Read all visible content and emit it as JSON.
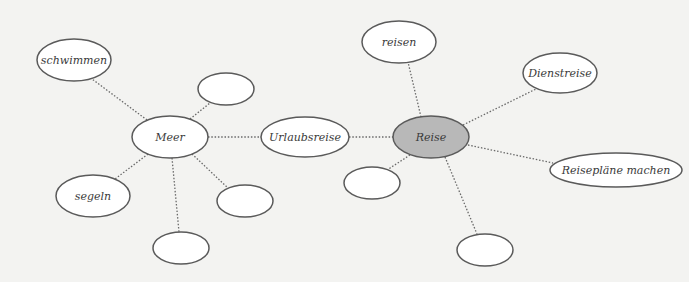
{
  "diagram": {
    "type": "mind-map",
    "center_node": "Reise",
    "colors": {
      "background": "#f3f3f1",
      "node_fill": "#ffffff",
      "center_fill": "#b8b8b8",
      "stroke": "#5a5a5a",
      "edge": "#6a6a6a"
    },
    "nodes": [
      {
        "id": "reise",
        "label": "Reise",
        "cx": 431,
        "cy": 137,
        "rx": 38,
        "ry": 21,
        "center": true
      },
      {
        "id": "urlaubsreise",
        "label": "Urlaubsreise",
        "cx": 305,
        "cy": 137,
        "rx": 44,
        "ry": 20
      },
      {
        "id": "meer",
        "label": "Meer",
        "cx": 170,
        "cy": 137,
        "rx": 38,
        "ry": 21
      },
      {
        "id": "schwimmen",
        "label": "schwimmen",
        "cx": 74,
        "cy": 60,
        "rx": 37,
        "ry": 21
      },
      {
        "id": "segeln",
        "label": "segeln",
        "cx": 93,
        "cy": 196,
        "rx": 37,
        "ry": 21
      },
      {
        "id": "empty-meer-top",
        "label": "",
        "cx": 226,
        "cy": 89,
        "rx": 28,
        "ry": 16
      },
      {
        "id": "empty-meer-right",
        "label": "",
        "cx": 245,
        "cy": 201,
        "rx": 28,
        "ry": 16
      },
      {
        "id": "empty-meer-bottom",
        "label": "",
        "cx": 181,
        "cy": 248,
        "rx": 28,
        "ry": 16
      },
      {
        "id": "reisen",
        "label": "reisen",
        "cx": 399,
        "cy": 42,
        "rx": 37,
        "ry": 21
      },
      {
        "id": "dienstreise",
        "label": "Dienstreise",
        "cx": 560,
        "cy": 73,
        "rx": 37,
        "ry": 20
      },
      {
        "id": "reiseplaene",
        "label": "Reisepläne machen",
        "cx": 616,
        "cy": 170,
        "rx": 66,
        "ry": 17
      },
      {
        "id": "empty-reise-left",
        "label": "",
        "cx": 372,
        "cy": 183,
        "rx": 28,
        "ry": 16
      },
      {
        "id": "empty-reise-bottom",
        "label": "",
        "cx": 485,
        "cy": 250,
        "rx": 28,
        "ry": 16
      }
    ],
    "edges": [
      {
        "from": "meer",
        "to": "urlaubsreise",
        "x1": 208,
        "y1": 137,
        "x2": 261,
        "y2": 137
      },
      {
        "from": "urlaubsreise",
        "to": "reise",
        "x1": 349,
        "y1": 137,
        "x2": 393,
        "y2": 137
      },
      {
        "from": "meer",
        "to": "schwimmen",
        "x1": 147,
        "y1": 120,
        "x2": 92,
        "y2": 79
      },
      {
        "from": "meer",
        "to": "segeln",
        "x1": 148,
        "y1": 154,
        "x2": 115,
        "y2": 179
      },
      {
        "from": "meer",
        "to": "empty-meer-top",
        "x1": 190,
        "y1": 119,
        "x2": 210,
        "y2": 103
      },
      {
        "from": "meer",
        "to": "empty-meer-right",
        "x1": 192,
        "y1": 154,
        "x2": 228,
        "y2": 188
      },
      {
        "from": "meer",
        "to": "empty-meer-bottom",
        "x1": 172,
        "y1": 158,
        "x2": 179,
        "y2": 232
      },
      {
        "from": "reise",
        "to": "reisen",
        "x1": 421,
        "y1": 117,
        "x2": 408,
        "y2": 62
      },
      {
        "from": "reise",
        "to": "dienstreise",
        "x1": 463,
        "y1": 125,
        "x2": 536,
        "y2": 89
      },
      {
        "from": "reise",
        "to": "reiseplaene",
        "x1": 468,
        "y1": 145,
        "x2": 553,
        "y2": 163
      },
      {
        "from": "reise",
        "to": "empty-reise-left",
        "x1": 410,
        "y1": 155,
        "x2": 387,
        "y2": 170
      },
      {
        "from": "reise",
        "to": "empty-reise-bottom",
        "x1": 445,
        "y1": 157,
        "x2": 477,
        "y2": 234
      }
    ]
  }
}
